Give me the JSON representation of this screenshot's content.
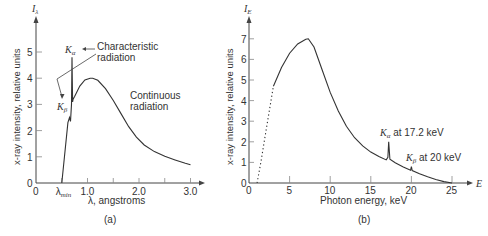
{
  "chart_data": [
    {
      "type": "line",
      "panel_label": "(a)",
      "title": "",
      "xlabel": "λ, angstroms",
      "ylabel": "x-ray intensity, relative units",
      "y_axis_symbol": "I",
      "y_axis_symbol_sub": "λ",
      "xlim": [
        0,
        3.2
      ],
      "ylim": [
        0,
        5.8
      ],
      "x_ticks": [
        0,
        0.5,
        1.0,
        1.5,
        2.0,
        2.5,
        3.0
      ],
      "x_tick_labels": [
        {
          "value": 0,
          "label": "0"
        },
        {
          "value": 0.5,
          "label": "λ",
          "sub": "min"
        },
        {
          "value": 1.0,
          "label": "1.0"
        },
        {
          "value": 2.0,
          "label": "2.0"
        },
        {
          "value": 3.0,
          "label": "3.0"
        }
      ],
      "y_ticks": [
        0,
        1,
        2,
        3,
        4,
        5
      ],
      "y_tick_labels": [
        "0",
        "1",
        "2",
        "3",
        "4",
        "5"
      ],
      "series": [
        {
          "name": "Spectrum",
          "x": [
            0.5,
            0.62,
            0.65,
            0.67,
            0.69,
            0.7,
            0.71,
            0.72,
            0.75,
            0.85,
            0.95,
            1.05,
            1.1,
            1.2,
            1.35,
            1.5,
            1.65,
            1.8,
            1.95,
            2.1,
            2.3,
            2.5,
            2.7,
            2.9,
            3.0
          ],
          "y": [
            0,
            2.3,
            2.5,
            2.35,
            3.0,
            4.8,
            3.1,
            3.2,
            3.3,
            3.7,
            3.93,
            4.0,
            4.0,
            3.92,
            3.6,
            3.15,
            2.65,
            2.15,
            1.75,
            1.45,
            1.2,
            1.02,
            0.88,
            0.75,
            0.7
          ]
        }
      ],
      "annotations": [
        {
          "text": "K",
          "sub": "α",
          "at_x": 0.7,
          "at_y": 4.8
        },
        {
          "text": "K",
          "sub": "β",
          "at_x": 0.65,
          "at_y": 2.5
        },
        {
          "text": "Characteristic radiation",
          "lines": [
            "Characteristic",
            "radiation"
          ]
        },
        {
          "text": "Continuous radiation",
          "lines": [
            "Continuous",
            "radiation"
          ]
        }
      ]
    },
    {
      "type": "line",
      "panel_label": "(b)",
      "title": "",
      "xlabel": "Photon energy, keV",
      "ylabel": "x-ray intensity, relative units",
      "y_axis_symbol": "I",
      "y_axis_symbol_sub": "E",
      "x_axis_symbol": "E",
      "xlim": [
        0,
        27.5
      ],
      "ylim": [
        0,
        7.8
      ],
      "x_ticks": [
        0,
        5,
        10,
        15,
        20,
        25
      ],
      "x_tick_labels": [
        "0",
        "5",
        "10",
        "15",
        "20",
        "25"
      ],
      "y_ticks": [
        0,
        1,
        2,
        3,
        4,
        5,
        6,
        7
      ],
      "y_tick_labels": [
        "0",
        "1",
        "2",
        "3",
        "4",
        "5",
        "6",
        "7"
      ],
      "series": [
        {
          "name": "Extrapolated (dotted)",
          "style": "dotted",
          "x": [
            1.0,
            1.5,
            2.0,
            2.5,
            3.0
          ],
          "y": [
            0,
            1.1,
            2.3,
            3.5,
            4.7
          ]
        },
        {
          "name": "Spectrum",
          "style": "solid",
          "x": [
            3.0,
            4.0,
            5.0,
            6.0,
            7.0,
            7.3,
            8.0,
            9.0,
            10.0,
            11.0,
            12.0,
            13.0,
            14.0,
            15.0,
            16.0,
            16.9,
            17.1,
            17.2,
            17.35,
            18.0,
            19.0,
            19.9,
            20.0,
            20.1,
            21.0,
            22.0,
            23.0,
            24.0,
            25.0
          ],
          "y": [
            4.7,
            5.6,
            6.3,
            6.75,
            6.98,
            7.0,
            6.6,
            5.5,
            4.4,
            3.5,
            2.75,
            2.2,
            1.8,
            1.5,
            1.28,
            1.12,
            1.25,
            2.0,
            1.15,
            0.98,
            0.78,
            0.62,
            0.8,
            0.6,
            0.45,
            0.3,
            0.17,
            0.07,
            0
          ]
        }
      ],
      "annotations": [
        {
          "text": "K",
          "sub": "α",
          "suffix": " at 17.2 keV",
          "at_x": 17.2,
          "at_y": 2.0
        },
        {
          "text": "K",
          "sub": "β",
          "suffix": " at 20 keV",
          "at_x": 20,
          "at_y": 0.8
        }
      ]
    }
  ],
  "labels": {
    "a": {
      "ylabel": "x-ray intensity, relative units",
      "xlabel": "λ, angstroms",
      "panel": "(a)",
      "char_line1": "Characteristic",
      "char_line2": "radiation",
      "cont_line1": "Continuous",
      "cont_line2": "radiation",
      "ka": "K",
      "ka_sub": "α",
      "kb": "K",
      "kb_sub": "β",
      "I": "I",
      "I_sub": "λ",
      "lmin": "λ",
      "lmin_sub": "min"
    },
    "b": {
      "ylabel": "x-ray intensity, relative units",
      "xlabel": "Photon energy, keV",
      "panel": "(b)",
      "ka": "K",
      "ka_sub": "α",
      "ka_text": " at 17.2 keV",
      "kb": "K",
      "kb_sub": "β",
      "kb_text": " at 20 keV",
      "I": "I",
      "I_sub": "E",
      "E": "E"
    }
  }
}
